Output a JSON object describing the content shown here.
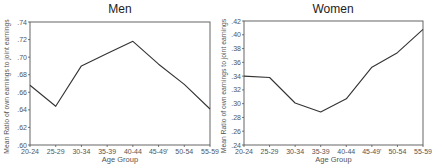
{
  "chart_data": [
    {
      "type": "line",
      "title": "Men",
      "xlabel": "Age Group",
      "ylabel": "Mean Ratio of own earnings to joint earnings",
      "categories": [
        "20-24",
        "25-29",
        "30-34",
        "35-39",
        "40-44",
        "45-49'",
        "50-54",
        "55-59"
      ],
      "values": [
        0.668,
        0.644,
        0.69,
        0.704,
        0.718,
        0.692,
        0.669,
        0.641
      ],
      "ylim": [
        0.6,
        0.74
      ],
      "yticks": [
        ".60",
        ".62",
        ".64",
        ".66",
        ".68",
        ".70",
        ".72",
        ".74"
      ],
      "grid": false,
      "legend": null
    },
    {
      "type": "line",
      "title": "Women",
      "xlabel": "Age Group",
      "ylabel": "Mean Ratio of own earnings to joint earnings",
      "categories": [
        "20-24",
        "25-29",
        "30-34",
        "35-39",
        "40-44",
        "45-49'",
        "50-54",
        "55-59"
      ],
      "values": [
        0.34,
        0.338,
        0.301,
        0.288,
        0.307,
        0.353,
        0.374,
        0.408
      ],
      "ylim": [
        0.24,
        0.42
      ],
      "yticks": [
        ".24",
        ".26",
        ".28",
        ".30",
        ".32",
        ".34",
        ".36",
        ".38",
        ".40",
        ".42"
      ],
      "grid": false,
      "legend": null
    }
  ],
  "colors": {
    "line": "#333333",
    "axis": "#555555"
  },
  "panels": [
    {
      "left": 30,
      "right": 210,
      "top": 22,
      "bottom": 145,
      "titleX": 120,
      "ylabelX": 9
    },
    {
      "left": 244,
      "right": 423,
      "top": 21,
      "bottom": 145,
      "titleX": 333,
      "ylabelX": 226
    }
  ]
}
